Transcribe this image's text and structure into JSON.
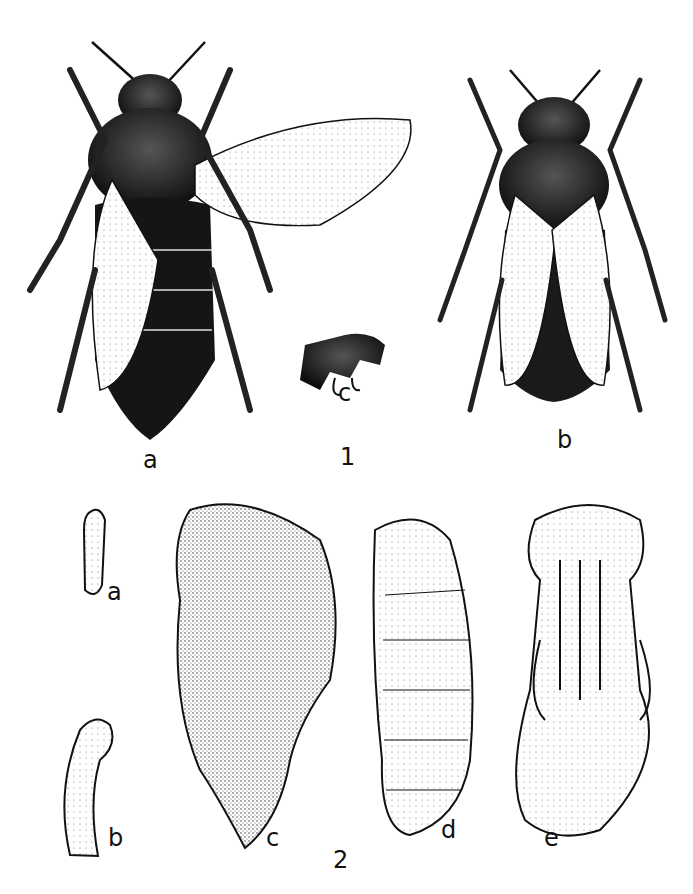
{
  "figure_1": {
    "number": "1",
    "panels": [
      {
        "label": "a",
        "subject": "queen bee, dorsal view, one wing spread"
      },
      {
        "label": "b",
        "subject": "worker bee, dorsal view, wings folded"
      },
      {
        "label": "c",
        "subject": "leg segment detail"
      }
    ]
  },
  "figure_2": {
    "number": "2",
    "panels": [
      {
        "label": "a",
        "subject": "egg"
      },
      {
        "label": "b",
        "subject": "young larva"
      },
      {
        "label": "c",
        "subject": "mature larva"
      },
      {
        "label": "d",
        "subject": "prepupa"
      },
      {
        "label": "e",
        "subject": "pupa, ventral view"
      }
    ]
  },
  "colors": {
    "ink": "#111111",
    "paper": "#ffffff",
    "shade": "#2a2a2a"
  }
}
